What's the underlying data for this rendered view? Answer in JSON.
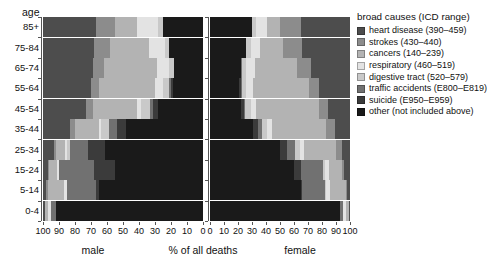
{
  "axes": {
    "age_axis_title": "age",
    "x_axis_title": "% of all deaths",
    "left_panel_name": "male",
    "right_panel_name": "female",
    "age_groups": [
      "85+",
      "75-84",
      "65-74",
      "55-64",
      "45-54",
      "35-44",
      "25-34",
      "15-24",
      "5-14",
      "0-4"
    ],
    "left_ticks": [
      "100",
      "90",
      "80",
      "70",
      "60",
      "50",
      "40",
      "30",
      "20",
      "10",
      "0"
    ],
    "right_ticks": [
      "0",
      "10",
      "20",
      "30",
      "40",
      "50",
      "60",
      "70",
      "80",
      "90",
      "100"
    ],
    "xlim": [
      0,
      100
    ]
  },
  "legend": {
    "title": "broad causes (ICD range)",
    "items": [
      {
        "label": "heart disease (390–459)",
        "color": "#4d4d4d",
        "key": "heart"
      },
      {
        "label": "strokes (430–440)",
        "color": "#8c8c8c",
        "key": "strokes"
      },
      {
        "label": "cancers (140–239)",
        "color": "#b3b3b3",
        "key": "cancers"
      },
      {
        "label": "respiratory (460–519)",
        "color": "#e3e3e3",
        "key": "respiratory"
      },
      {
        "label": "digestive tract (520–579)",
        "color": "#c9c9c9",
        "key": "digestive"
      },
      {
        "label": "traffic accidents (E800–E819)",
        "color": "#717171",
        "key": "traffic"
      },
      {
        "label": "suicide (E950–E959)",
        "color": "#3b3b3b",
        "key": "suicide"
      },
      {
        "label": "other (not included above)",
        "color": "#1a1a1a",
        "key": "other"
      }
    ]
  },
  "chart_data": {
    "type": "bar",
    "subtype": "back-to-back stacked horizontal bars (population pyramid)",
    "title": "",
    "xlabel": "% of all deaths",
    "ylabel": "age",
    "xlim": [
      0,
      100
    ],
    "grid": false,
    "legend_position": "right",
    "stack_order": [
      "heart",
      "strokes",
      "cancers",
      "respiratory",
      "digestive",
      "traffic",
      "suicide",
      "other"
    ],
    "categories": [
      "85+",
      "75-84",
      "65-74",
      "55-64",
      "45-54",
      "35-44",
      "25-34",
      "15-24",
      "5-14",
      "0-4"
    ],
    "note": "Each row sums to 100% of deaths in that age/sex group. Male bars are drawn right-to-left from the 100 mark; female bars left-to-right.",
    "series": [
      {
        "name": "male",
        "stacks": [
          {
            "age": "85+",
            "heart": 33,
            "strokes": 12,
            "cancers": 14,
            "respiratory": 13,
            "digestive": 3,
            "traffic": 0,
            "suicide": 0,
            "other": 25
          },
          {
            "age": "75-84",
            "heart": 32,
            "strokes": 10,
            "cancers": 24,
            "respiratory": 10,
            "digestive": 3,
            "traffic": 0,
            "suicide": 0,
            "other": 21
          },
          {
            "age": "65-74",
            "heart": 31,
            "strokes": 7,
            "cancers": 33,
            "respiratory": 8,
            "digestive": 3,
            "traffic": 0,
            "suicide": 0,
            "other": 18
          },
          {
            "age": "55-64",
            "heart": 30,
            "strokes": 5,
            "cancers": 35,
            "respiratory": 5,
            "digestive": 4,
            "traffic": 1,
            "suicide": 1,
            "other": 19
          },
          {
            "age": "45-54",
            "heart": 27,
            "strokes": 4,
            "cancers": 28,
            "respiratory": 2,
            "digestive": 6,
            "traffic": 2,
            "suicide": 3,
            "other": 28
          },
          {
            "age": "35-44",
            "heart": 17,
            "strokes": 3,
            "cancers": 15,
            "respiratory": 1,
            "digestive": 5,
            "traffic": 5,
            "suicide": 6,
            "other": 48
          },
          {
            "age": "25-34",
            "heart": 7,
            "strokes": 1,
            "cancers": 6,
            "respiratory": 1,
            "digestive": 2,
            "traffic": 11,
            "suicide": 11,
            "other": 61
          },
          {
            "age": "15-24",
            "heart": 3,
            "strokes": 1,
            "cancers": 5,
            "respiratory": 1,
            "digestive": 0,
            "traffic": 22,
            "suicide": 13,
            "other": 55
          },
          {
            "age": "5-14",
            "heart": 2,
            "strokes": 1,
            "cancers": 10,
            "respiratory": 2,
            "digestive": 0,
            "traffic": 18,
            "suicide": 2,
            "other": 65
          },
          {
            "age": "0-4",
            "heart": 1,
            "strokes": 0,
            "cancers": 2,
            "respiratory": 2,
            "digestive": 0,
            "traffic": 3,
            "suicide": 0,
            "other": 92
          }
        ]
      },
      {
        "name": "female",
        "stacks": [
          {
            "age": "85+",
            "heart": 35,
            "strokes": 15,
            "cancers": 9,
            "respiratory": 8,
            "digestive": 3,
            "traffic": 0,
            "suicide": 0,
            "other": 30
          },
          {
            "age": "75-84",
            "heart": 34,
            "strokes": 14,
            "cancers": 16,
            "respiratory": 7,
            "digestive": 3,
            "traffic": 0,
            "suicide": 0,
            "other": 26
          },
          {
            "age": "65-74",
            "heart": 28,
            "strokes": 10,
            "cancers": 30,
            "respiratory": 6,
            "digestive": 3,
            "traffic": 1,
            "suicide": 0,
            "other": 22
          },
          {
            "age": "55-64",
            "heart": 22,
            "strokes": 7,
            "cancers": 40,
            "respiratory": 5,
            "digestive": 3,
            "traffic": 1,
            "suicide": 1,
            "other": 21
          },
          {
            "age": "45-54",
            "heart": 16,
            "strokes": 6,
            "cancers": 45,
            "respiratory": 4,
            "digestive": 4,
            "traffic": 1,
            "suicide": 2,
            "other": 22
          },
          {
            "age": "35-44",
            "heart": 11,
            "strokes": 6,
            "cancers": 39,
            "respiratory": 3,
            "digestive": 4,
            "traffic": 3,
            "suicide": 3,
            "other": 31
          },
          {
            "age": "25-34",
            "heart": 6,
            "strokes": 4,
            "cancers": 23,
            "respiratory": 3,
            "digestive": 3,
            "traffic": 6,
            "suicide": 5,
            "other": 50
          },
          {
            "age": "15-24",
            "heart": 4,
            "strokes": 2,
            "cancers": 9,
            "respiratory": 3,
            "digestive": 1,
            "traffic": 16,
            "suicide": 5,
            "other": 60
          },
          {
            "age": "5-14",
            "heart": 2,
            "strokes": 1,
            "cancers": 11,
            "respiratory": 3,
            "digestive": 1,
            "traffic": 16,
            "suicide": 1,
            "other": 65
          },
          {
            "age": "0-4",
            "heart": 1,
            "strokes": 0,
            "cancers": 2,
            "respiratory": 2,
            "digestive": 0,
            "traffic": 2,
            "suicide": 0,
            "other": 93
          }
        ]
      }
    ]
  }
}
